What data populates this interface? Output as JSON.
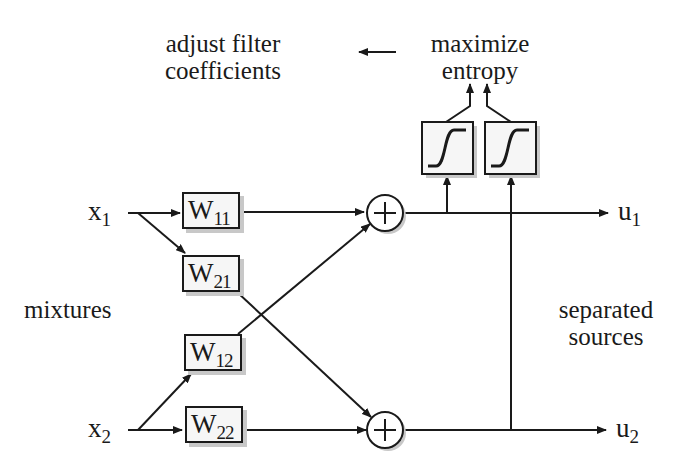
{
  "diagram": {
    "type": "blind-source-separation-network",
    "top_labels": {
      "adjust": [
        "adjust filter",
        "coefficients"
      ],
      "maximize": [
        "maximize",
        "entropy"
      ]
    },
    "side_labels": {
      "left": "mixtures",
      "right": [
        "separated",
        "sources"
      ]
    },
    "inputs": [
      {
        "name": "x",
        "sub": "1"
      },
      {
        "name": "x",
        "sub": "2"
      }
    ],
    "outputs": [
      {
        "name": "u",
        "sub": "1"
      },
      {
        "name": "u",
        "sub": "2"
      }
    ],
    "weights": [
      {
        "name": "W",
        "sub": "11"
      },
      {
        "name": "W",
        "sub": "21"
      },
      {
        "name": "W",
        "sub": "12"
      },
      {
        "name": "W",
        "sub": "22"
      }
    ],
    "summers": [
      "+",
      "+"
    ],
    "nonlinearities": [
      "sigmoid",
      "sigmoid"
    ],
    "colors": {
      "line": "#1a1a1a",
      "shadow": "#c8c8c8",
      "box_fill": "#f6f6f6"
    }
  }
}
